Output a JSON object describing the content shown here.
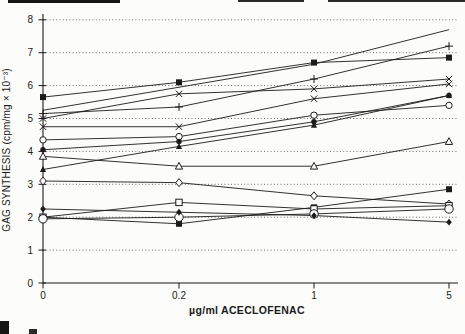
{
  "figure": {
    "background": "#fcfcfa",
    "ink_color": "#1b1b1b",
    "grid_color": "#4a4a4a"
  },
  "chart_data": {
    "type": "line",
    "title": "",
    "xlabel": "µg/ml ACECLOFENAC",
    "ylabel": "GAG SYNTHESIS (cpm/mg × 10⁻³)",
    "x_categories": [
      "0",
      "0.2",
      "1",
      "5"
    ],
    "y_ticks": [
      0,
      1,
      2,
      3,
      4,
      5,
      6,
      7,
      8
    ],
    "ylim": [
      0,
      8.2
    ],
    "grid": "horizontal-dotted",
    "legend": "none",
    "series": [
      {
        "name": "line-no-marker",
        "marker": "none",
        "values": [
          5.25,
          5.95,
          6.65,
          7.7
        ]
      },
      {
        "name": "plus",
        "marker": "plus",
        "values": [
          5.15,
          5.35,
          6.2,
          7.2
        ]
      },
      {
        "name": "filled-square-upper",
        "marker": "square-filled",
        "values": [
          5.65,
          6.1,
          6.7,
          6.85
        ]
      },
      {
        "name": "x-upper",
        "marker": "x",
        "values": [
          5.0,
          5.75,
          5.9,
          6.2
        ]
      },
      {
        "name": "x-lower",
        "marker": "x",
        "values": [
          4.75,
          4.75,
          5.6,
          6.05
        ]
      },
      {
        "name": "open-circle-mid",
        "marker": "circle-open",
        "values": [
          4.35,
          4.45,
          5.1,
          5.4
        ]
      },
      {
        "name": "filled-circle",
        "marker": "circle-filled",
        "values": [
          4.05,
          4.3,
          4.9,
          5.7
        ]
      },
      {
        "name": "filled-triangle",
        "marker": "triangle-filled",
        "values": [
          3.45,
          4.15,
          4.8,
          5.7
        ]
      },
      {
        "name": "open-triangle",
        "marker": "triangle-open",
        "values": [
          3.85,
          3.55,
          3.55,
          4.3
        ]
      },
      {
        "name": "open-diamond",
        "marker": "diamond-open",
        "values": [
          3.1,
          3.05,
          2.65,
          2.4
        ]
      },
      {
        "name": "filled-square-lower",
        "marker": "square-filled",
        "values": [
          2.0,
          1.8,
          2.3,
          2.85
        ]
      },
      {
        "name": "open-square",
        "marker": "square-open",
        "values": [
          2.0,
          2.45,
          2.25,
          2.35
        ]
      },
      {
        "name": "open-circle-lower",
        "marker": "circle-open-large",
        "values": [
          1.95,
          2.0,
          2.1,
          2.25
        ]
      },
      {
        "name": "filled-diamond",
        "marker": "diamond-filled",
        "values": [
          2.25,
          2.15,
          2.05,
          1.85
        ]
      }
    ]
  }
}
